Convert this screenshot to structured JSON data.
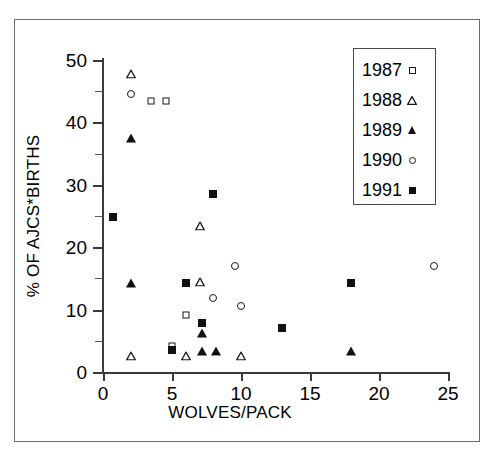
{
  "chart_data": {
    "type": "scatter",
    "title": "",
    "xlabel": "WOLVES/PACK",
    "ylabel": "% OF AJCS*BIRTHS",
    "xlim": [
      0,
      25
    ],
    "ylim": [
      0,
      50
    ],
    "xticks": [
      0,
      5,
      10,
      15,
      20,
      25
    ],
    "yticks": [
      0,
      10,
      20,
      30,
      40,
      50
    ],
    "xtick_labels": [
      "0",
      "5",
      "10",
      "15",
      "20",
      "25"
    ],
    "ytick_labels": [
      "0",
      "10",
      "20",
      "30",
      "40",
      "50"
    ],
    "grid": false,
    "legend_position": "top-right",
    "series": [
      {
        "name": "1987",
        "marker": "open-square",
        "points": [
          {
            "x": 3.5,
            "y": 43.5
          },
          {
            "x": 4.6,
            "y": 43.5
          },
          {
            "x": 6.0,
            "y": 9.2
          },
          {
            "x": 5.0,
            "y": 4.2
          }
        ]
      },
      {
        "name": "1988",
        "marker": "open-triangle",
        "points": [
          {
            "x": 2.0,
            "y": 48.5
          },
          {
            "x": 7.0,
            "y": 24.2
          },
          {
            "x": 7.0,
            "y": 15.2
          },
          {
            "x": 2.0,
            "y": 3.3
          },
          {
            "x": 6.0,
            "y": 3.4
          },
          {
            "x": 10.0,
            "y": 3.4
          }
        ]
      },
      {
        "name": "1989",
        "marker": "filled-triangle",
        "points": [
          {
            "x": 2.0,
            "y": 37.5
          },
          {
            "x": 2.0,
            "y": 14.2
          },
          {
            "x": 7.2,
            "y": 6.3
          },
          {
            "x": 7.2,
            "y": 3.4
          },
          {
            "x": 8.2,
            "y": 3.4
          },
          {
            "x": 18.0,
            "y": 3.4
          }
        ]
      },
      {
        "name": "1990",
        "marker": "open-circle",
        "points": [
          {
            "x": 2.0,
            "y": 44.5
          },
          {
            "x": 9.6,
            "y": 17.0
          },
          {
            "x": 8.0,
            "y": 11.8
          },
          {
            "x": 10.0,
            "y": 10.5
          },
          {
            "x": 24.0,
            "y": 17.0
          }
        ]
      },
      {
        "name": "1991",
        "marker": "filled-square",
        "points": [
          {
            "x": 0.7,
            "y": 24.8
          },
          {
            "x": 8.0,
            "y": 28.5
          },
          {
            "x": 6.0,
            "y": 14.2
          },
          {
            "x": 18.0,
            "y": 14.2
          },
          {
            "x": 7.2,
            "y": 7.8
          },
          {
            "x": 13.0,
            "y": 7.1
          },
          {
            "x": 5.0,
            "y": 3.5
          }
        ]
      }
    ]
  },
  "legend": {
    "entries": [
      {
        "label": "1987",
        "marker": "open-square"
      },
      {
        "label": "1988",
        "marker": "open-triangle"
      },
      {
        "label": "1989",
        "marker": "filled-triangle"
      },
      {
        "label": "1990",
        "marker": "open-circle"
      },
      {
        "label": "1991",
        "marker": "filled-square"
      }
    ]
  }
}
